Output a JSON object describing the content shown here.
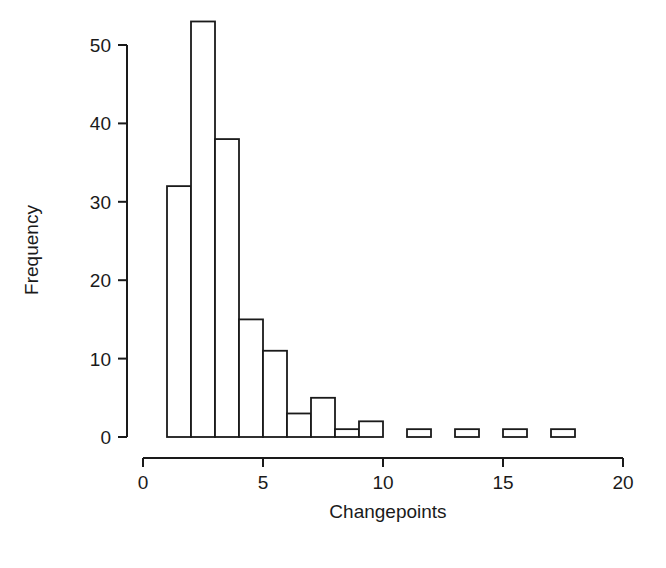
{
  "chart_data": {
    "type": "bar",
    "title": "",
    "subtitle": "",
    "xlabel": "Changepoints",
    "ylabel": "Frequency",
    "xlim": [
      0,
      20
    ],
    "ylim": [
      0,
      53
    ],
    "grid": false,
    "legend": null,
    "legend_position": "none",
    "bin_width": 1,
    "bin_starts": [
      1,
      2,
      3,
      4,
      5,
      6,
      7,
      8,
      9,
      10,
      11,
      12,
      13,
      14,
      15,
      16,
      17
    ],
    "bin_ends": [
      2,
      3,
      4,
      5,
      6,
      7,
      8,
      9,
      10,
      11,
      12,
      13,
      14,
      15,
      16,
      17,
      18
    ],
    "categories": [
      "1-2",
      "2-3",
      "3-4",
      "4-5",
      "5-6",
      "6-7",
      "7-8",
      "8-9",
      "9-10",
      "10-11",
      "11-12",
      "12-13",
      "13-14",
      "14-15",
      "15-16",
      "16-17",
      "17-18"
    ],
    "values": [
      32,
      53,
      38,
      15,
      11,
      3,
      5,
      1,
      2,
      0,
      1,
      0,
      1,
      0,
      1,
      0,
      1
    ],
    "x_ticks": [
      0,
      5,
      10,
      15,
      20
    ],
    "x_tick_labels": [
      "0",
      "5",
      "10",
      "15",
      "20"
    ],
    "y_ticks": [
      0,
      10,
      20,
      30,
      40,
      50
    ],
    "y_tick_labels": [
      "0",
      "10",
      "20",
      "30",
      "40",
      "50"
    ],
    "bar_fill_color": "#ffffff",
    "bar_stroke_color": "#1a1a1a",
    "axis_color": "#1a1a1a",
    "background_color": "#ffffff"
  },
  "axes": {
    "x_title": "Changepoints",
    "y_title": "Frequency",
    "x_tick_labels": [
      "0",
      "5",
      "10",
      "15",
      "20"
    ],
    "y_tick_labels": [
      "0",
      "10",
      "20",
      "30",
      "40",
      "50"
    ]
  }
}
